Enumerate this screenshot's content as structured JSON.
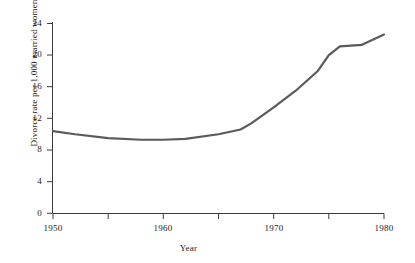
{
  "chart_data": {
    "type": "line",
    "title": "",
    "xlabel": "Year",
    "ylabel": "Divorce rate per 1,000 married women",
    "xlim": [
      1950,
      1980
    ],
    "ylim": [
      0,
      24
    ],
    "grid": false,
    "legend": null,
    "line_color": "#5a5a5a",
    "x": [
      1950,
      1952,
      1955,
      1958,
      1960,
      1962,
      1965,
      1967,
      1968,
      1970,
      1972,
      1974,
      1975,
      1976,
      1978,
      1980
    ],
    "values": [
      10.4,
      10.0,
      9.5,
      9.3,
      9.3,
      9.4,
      10.0,
      10.6,
      11.4,
      13.4,
      15.5,
      18.0,
      20.0,
      21.1,
      21.3,
      22.6
    ],
    "xticks": [
      1950,
      1955,
      1960,
      1965,
      1970,
      1975,
      1980
    ],
    "xticklabels": [
      "1950",
      "",
      "1960",
      "",
      "1970",
      "",
      "1980"
    ],
    "yticks": [
      0,
      4,
      8,
      12,
      16,
      20,
      24
    ],
    "yticklabels": [
      "0",
      "4",
      "8",
      "12",
      "16",
      "20",
      "24"
    ],
    "series_name": "Divorce rate"
  },
  "axis": {
    "x_label_text": "Year",
    "y_label_text": "Divorce rate per 1,000 married women"
  }
}
